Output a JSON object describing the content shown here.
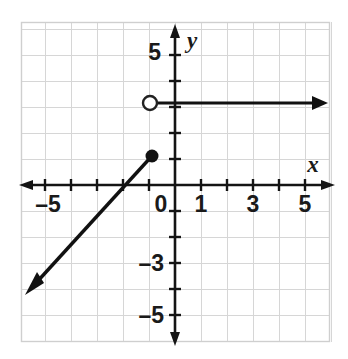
{
  "figure": {
    "title": "",
    "background_color": "#ffffff",
    "grid_color": "#d4d4d4",
    "axis_color": "#1a1a1a",
    "curve_color": "#111111"
  },
  "axis_labels": {
    "x_label": "x",
    "y_label": "y"
  },
  "tick_labels": {
    "x": [
      "–5",
      "0",
      "1",
      "3",
      "5"
    ],
    "y": [
      "5",
      "–3",
      "–5"
    ]
  },
  "chart_data": {
    "type": "line",
    "title": "",
    "xlabel": "x",
    "ylabel": "y",
    "xlim": [
      -6,
      6
    ],
    "ylim": [
      -6,
      6
    ],
    "grid": true,
    "legend": "none",
    "x_ticks": [
      -5,
      -4,
      -3,
      -2,
      -1,
      0,
      1,
      2,
      3,
      4,
      5
    ],
    "y_ticks": [
      -5,
      -4,
      -3,
      -2,
      -1,
      0,
      1,
      2,
      3,
      4,
      5
    ],
    "x_tick_labels_shown": [
      {
        "value": -5,
        "label": "–5"
      },
      {
        "value": 0,
        "label": "0"
      },
      {
        "value": 1,
        "label": "1"
      },
      {
        "value": 3,
        "label": "3"
      },
      {
        "value": 5,
        "label": "5"
      }
    ],
    "y_tick_labels_shown": [
      {
        "value": 5,
        "label": "5"
      },
      {
        "value": -3,
        "label": "–3"
      },
      {
        "value": -5,
        "label": "–5"
      }
    ],
    "series": [
      {
        "name": "ray-lower-left",
        "description": "slanted ray from closed endpoint going down-left, slope 1",
        "type": "ray",
        "start": {
          "x": -1,
          "y": 1,
          "endpoint": "closed"
        },
        "end": {
          "x": -5.7,
          "y": -4.1,
          "endpoint": "arrow"
        },
        "slope": 1,
        "equation": "y = x + 2"
      },
      {
        "name": "ray-horizontal-right",
        "description": "horizontal ray from open endpoint going right at y = 3",
        "type": "ray",
        "start": {
          "x": -1,
          "y": 3,
          "endpoint": "open"
        },
        "end": {
          "x": 5.8,
          "y": 3,
          "endpoint": "arrow"
        },
        "slope": 0,
        "equation": "y = 3"
      }
    ],
    "points": [
      {
        "x": -1,
        "y": 1,
        "style": "filled",
        "label": ""
      },
      {
        "x": -1,
        "y": 3,
        "style": "open",
        "label": ""
      }
    ]
  }
}
